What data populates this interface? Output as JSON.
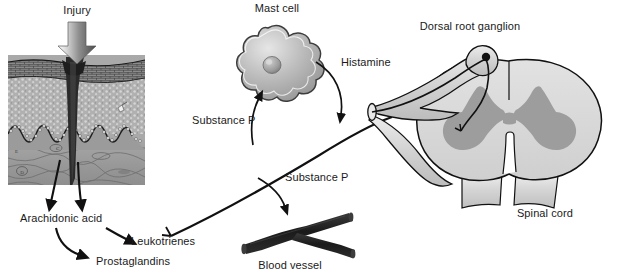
{
  "figure": {
    "caption_number": "",
    "caption_text": ""
  },
  "labels": {
    "injury": "Injury",
    "mast_cell": "Mast cell",
    "dorsal_root_ganglion": "Dorsal root ganglion",
    "histamine": "Histamine",
    "substance_p_upper": "Substance P",
    "substance_p_lower": "Substance P",
    "arachidonic_acid": "Arachidonic acid",
    "leukotrienes": "Leukotrienes",
    "prostaglandins": "Prostaglandins",
    "blood_vessel": "Blood vessel",
    "spinal_cord": "Spinal cord"
  },
  "icons": {
    "injury_arrow": "down-block-arrow-icon",
    "mast_cell_shape": "mast-cell-icon",
    "blood_vessel_shape": "blood-vessel-icon",
    "spinal_cord_shape": "spinal-cord-cross-section-icon",
    "ganglion_dot": "ganglion-cell-body-icon",
    "skin_inset": "skin-wound-histology-icon",
    "nerve_fiber": "nerve-fiber-icon"
  },
  "colors": {
    "outline": "#111111",
    "tissue_fill": "#a8a8a8",
    "gray_matter": "#9c9c9c",
    "white_matter": "#d8d8d8",
    "nerve_fill": "#d4d4d4",
    "vessel_fill": "#1f1f1f",
    "mast_cell_fill": "#b5b5b5",
    "arrow_gray": "#8c8c8c",
    "background": "#ffffff"
  }
}
